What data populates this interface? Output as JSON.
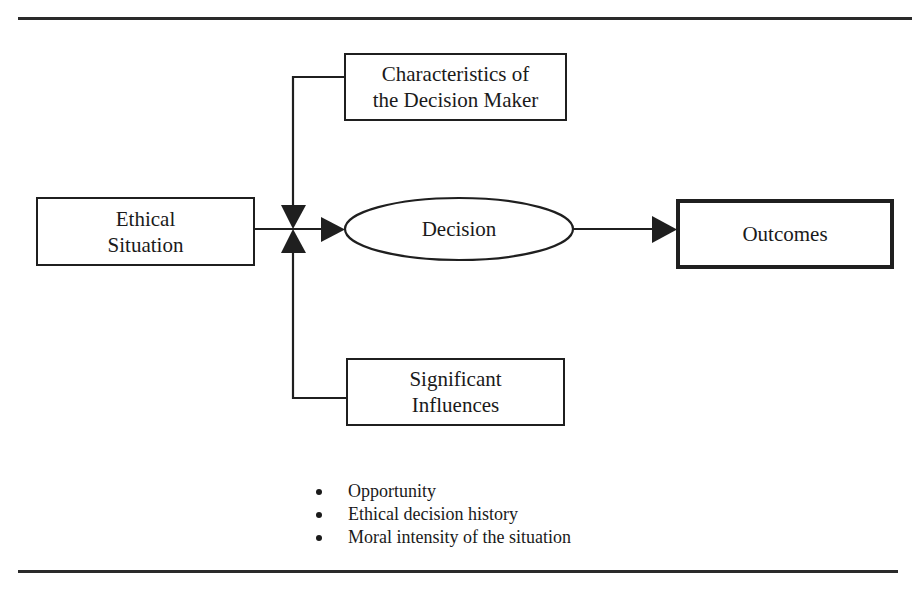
{
  "diagram": {
    "nodes": {
      "ethical_situation": {
        "line1": "Ethical",
        "line2": "Situation"
      },
      "characteristics": {
        "line1": "Characteristics of",
        "line2": "the Decision Maker"
      },
      "decision": {
        "label": "Decision"
      },
      "outcomes": {
        "label": "Outcomes"
      },
      "significant_influences": {
        "line1": "Significant",
        "line2": "Influences"
      }
    },
    "influences_list": [
      "Opportunity",
      "Ethical decision history",
      "Moral intensity of the situation"
    ],
    "edges": [
      {
        "from": "Ethical Situation",
        "to": "Decision"
      },
      {
        "from": "Characteristics of the Decision Maker",
        "to": "Decision"
      },
      {
        "from": "Significant Influences",
        "to": "Decision"
      },
      {
        "from": "Decision",
        "to": "Outcomes"
      }
    ],
    "colors": {
      "stroke": "#1f1f1f",
      "background": "#ffffff"
    }
  }
}
